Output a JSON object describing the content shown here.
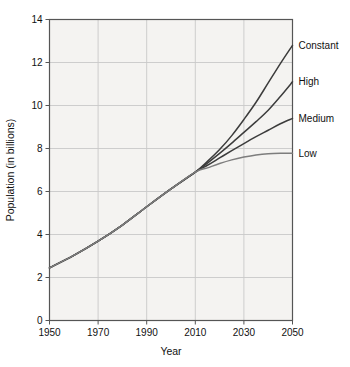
{
  "chart_data": {
    "type": "line",
    "title": "",
    "xlabel": "Year",
    "ylabel": "Population (in billions)",
    "xlim": [
      1950,
      2050
    ],
    "ylim": [
      0,
      14
    ],
    "xticks": [
      1950,
      1970,
      1990,
      2010,
      2030,
      2050
    ],
    "yticks": [
      0,
      2,
      4,
      6,
      8,
      10,
      12,
      14
    ],
    "grid": true,
    "legend_position": "right-of-axes-inline",
    "x": [
      1950,
      1960,
      1970,
      1980,
      1990,
      2000,
      2010,
      2015,
      2020,
      2025,
      2030,
      2035,
      2040,
      2045,
      2050
    ],
    "series": [
      {
        "name": "Constant",
        "color": "#3c3c3c",
        "values": [
          2.45,
          3.03,
          3.69,
          4.44,
          5.29,
          6.12,
          6.9,
          7.4,
          7.95,
          8.6,
          9.35,
          10.15,
          11.05,
          11.95,
          12.8
        ]
      },
      {
        "name": "High",
        "color": "#3c3c3c",
        "values": [
          2.45,
          3.03,
          3.69,
          4.44,
          5.29,
          6.12,
          6.9,
          7.32,
          7.77,
          8.25,
          8.75,
          9.25,
          9.78,
          10.42,
          11.1
        ]
      },
      {
        "name": "Medium",
        "color": "#3c3c3c",
        "values": [
          2.45,
          3.03,
          3.69,
          4.44,
          5.29,
          6.12,
          6.9,
          7.22,
          7.56,
          7.9,
          8.23,
          8.55,
          8.85,
          9.15,
          9.4
        ]
      },
      {
        "name": "Low",
        "color": "#7d7d7d",
        "values": [
          2.45,
          3.03,
          3.69,
          4.44,
          5.29,
          6.12,
          6.9,
          7.1,
          7.3,
          7.47,
          7.6,
          7.7,
          7.76,
          7.78,
          7.78
        ]
      }
    ]
  },
  "axes": {
    "x_tick_labels": [
      "1950",
      "1970",
      "1990",
      "2010",
      "2030",
      "2050"
    ],
    "y_tick_labels": [
      "0",
      "2",
      "4",
      "6",
      "8",
      "10",
      "12",
      "14"
    ],
    "x_title": "Year",
    "y_title": "Population (in billions)"
  },
  "series_labels": [
    {
      "text": "Constant",
      "y_value": 12.8
    },
    {
      "text": "High",
      "y_value": 11.1
    },
    {
      "text": "Medium",
      "y_value": 9.4
    },
    {
      "text": "Low",
      "y_value": 7.78
    }
  ],
  "colors": {
    "plot_background": "#f4f3f1",
    "page_background": "#ffffff",
    "grid": "#c8c8c8",
    "axis": "#555555",
    "line_dark": "#3c3c3c",
    "line_gray": "#7d7d7d",
    "text": "#111111"
  }
}
